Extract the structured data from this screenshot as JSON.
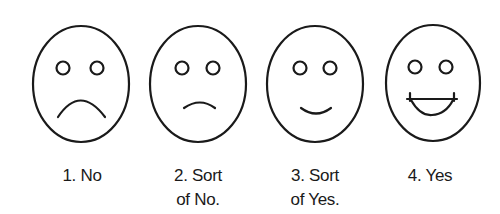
{
  "scale": {
    "stroke_color": "#1a1a1a",
    "background": "#ffffff",
    "items": [
      {
        "number": "1",
        "line1": "1. No",
        "line2": "",
        "expression": "frown"
      },
      {
        "number": "2",
        "line1": "2. Sort",
        "line2": "of No.",
        "expression": "slight-frown"
      },
      {
        "number": "3",
        "line1": "3. Sort",
        "line2": "of Yes.",
        "expression": "slight-smile"
      },
      {
        "number": "4",
        "line1": "4. Yes",
        "line2": "",
        "expression": "big-smile"
      }
    ]
  }
}
